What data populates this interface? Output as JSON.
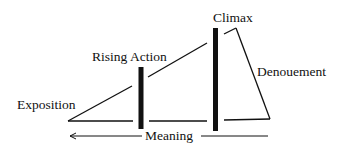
{
  "diagram": {
    "type": "plot-structure",
    "labels": {
      "exposition": "Exposition",
      "rising_action": "Rising Action",
      "climax": "Climax",
      "denouement": "Denouement",
      "meaning": "Meaning"
    },
    "colors": {
      "stroke": "#111111",
      "background": "#ffffff"
    }
  }
}
